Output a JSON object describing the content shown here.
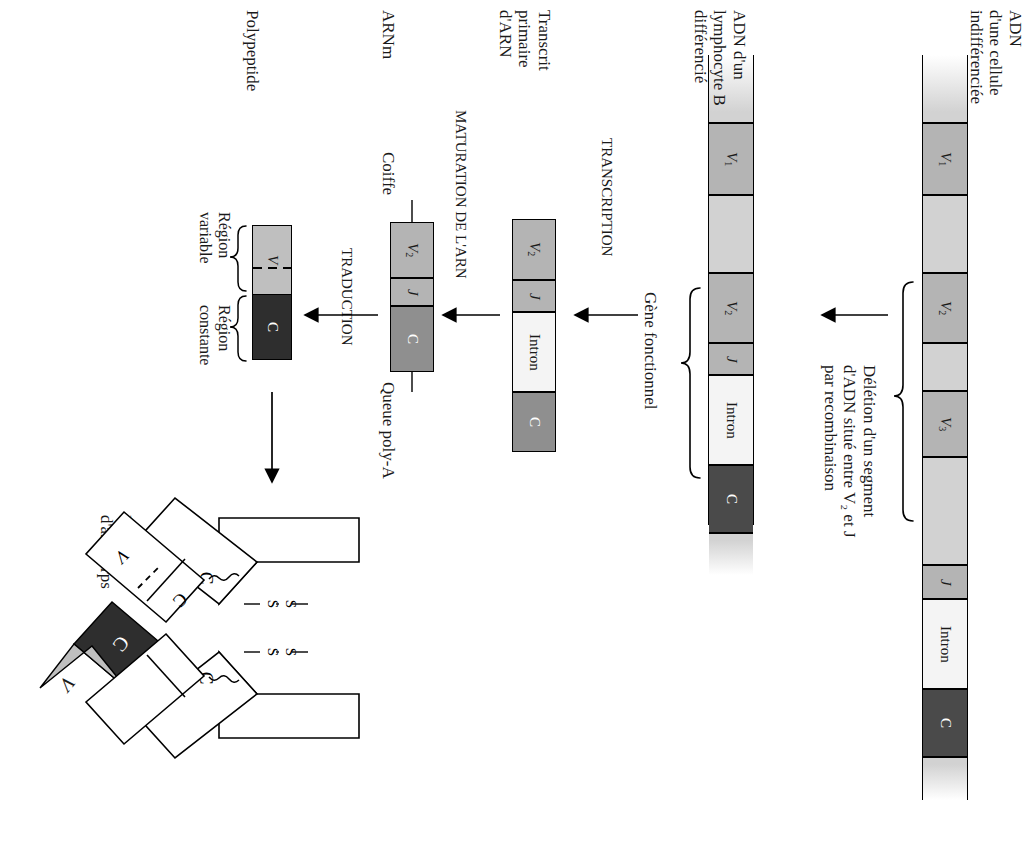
{
  "figure": {
    "language": "fr",
    "orientation": "rotated-90-clockwise"
  },
  "colors": {
    "spacer": "#d2d2d2",
    "v_segment": "#b4b4b4",
    "j_segment": "#b4b4b4",
    "intron": "#f4f4f4",
    "constant_dark": "#4a4a4a",
    "constant_mid": "#8f8f8f",
    "variable_light": "#bfbfbf",
    "constant_darkest": "#2e2e2e",
    "outline": "#000000",
    "background": "#ffffff"
  },
  "stages": {
    "germline_dna": {
      "label": "ADN\nd'une cellule\nindifférenciée",
      "segments": [
        {
          "name": "spacer-top",
          "label": "",
          "kind": "fade"
        },
        {
          "name": "V1",
          "label": "V",
          "sub": "1",
          "kind": "v"
        },
        {
          "name": "spacer-1",
          "label": "",
          "kind": "spacer"
        },
        {
          "name": "V2",
          "label": "V",
          "sub": "2",
          "kind": "v"
        },
        {
          "name": "spacer-2",
          "label": "",
          "kind": "spacer"
        },
        {
          "name": "V3",
          "label": "V",
          "sub": "3",
          "kind": "v"
        },
        {
          "name": "spacer-3",
          "label": "",
          "kind": "spacer"
        },
        {
          "name": "J",
          "label": "J",
          "kind": "j",
          "italic": true
        },
        {
          "name": "Intron",
          "label": "Intron",
          "kind": "intron"
        },
        {
          "name": "C",
          "label": "C",
          "kind": "c"
        },
        {
          "name": "spacer-bottom",
          "label": "",
          "kind": "fade"
        }
      ]
    },
    "deletion": {
      "label": "Délétion d'un segment\nd'ADN situé entre V₂ et J\npar recombinaison",
      "brace": true
    },
    "bcell_dna": {
      "label": "ADN d'un\nlymphocyte B\ndifférencié",
      "gene_label": "Gène fonctionnel",
      "segments": [
        {
          "name": "spacer-top",
          "label": "",
          "kind": "fade"
        },
        {
          "name": "V1",
          "label": "V",
          "sub": "1",
          "kind": "v"
        },
        {
          "name": "spacer-1",
          "label": "",
          "kind": "spacer"
        },
        {
          "name": "V2",
          "label": "V",
          "sub": "2",
          "kind": "v"
        },
        {
          "name": "J",
          "label": "J",
          "kind": "j",
          "italic": true
        },
        {
          "name": "Intron",
          "label": "Intron",
          "kind": "intron"
        },
        {
          "name": "C",
          "label": "C",
          "kind": "c"
        },
        {
          "name": "spacer-bottom",
          "label": "",
          "kind": "fade"
        }
      ]
    },
    "transcription": {
      "label": "TRANSCRIPTION"
    },
    "primary_transcript": {
      "label": "Transcrit\nprimaire\nd'ARN",
      "segments": [
        {
          "name": "V2",
          "label": "V",
          "sub": "2",
          "kind": "v"
        },
        {
          "name": "J",
          "label": "J",
          "kind": "j",
          "italic": true
        },
        {
          "name": "Intron",
          "label": "Intron",
          "kind": "intron"
        },
        {
          "name": "C",
          "label": "C",
          "kind": "cmid"
        }
      ]
    },
    "rna_maturation": {
      "label": "MATURATION DE L'ARN"
    },
    "mrna": {
      "label": "ARNm",
      "cap_label": "Coiffe",
      "tail_label": "Queue poly-A",
      "segments": [
        {
          "name": "V2",
          "label": "V",
          "sub": "2",
          "kind": "v"
        },
        {
          "name": "J",
          "label": "J",
          "kind": "j",
          "italic": true
        },
        {
          "name": "C",
          "label": "C",
          "kind": "cmid"
        }
      ]
    },
    "translation": {
      "label": "TRADUCTION"
    },
    "polypeptide": {
      "label": "Polypeptide",
      "variable_region_label": "Région\nvariable",
      "constant_region_label": "Région\nconstante",
      "segments": [
        {
          "name": "V",
          "label": "V",
          "kind": "vlight"
        },
        {
          "name": "C",
          "label": "C",
          "kind": "cdark"
        }
      ]
    },
    "antibody": {
      "label": "Molécule\nd'anticorps",
      "chain_labels": {
        "heavy_c": "C",
        "heavy_v": "V",
        "light_c": "C",
        "light_v": "V"
      },
      "disulfide_label": "S",
      "disulfide_count": 2
    }
  }
}
